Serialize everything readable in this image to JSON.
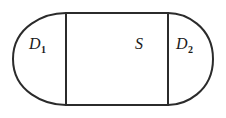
{
  "figure": {
    "name": "stadium-divided-into-three-regions",
    "background_color": "#ffffff",
    "stroke_color": "#2b2b2b",
    "stroke_width": 2,
    "geometry": {
      "left_cap_x": 13,
      "left_divider_x": 66,
      "right_divider_x": 168,
      "right_cap_x": 213,
      "top_y": 13,
      "bottom_y": 105
    },
    "labels": {
      "left_region": {
        "glyph": "D",
        "subscript": "1",
        "full": "D1"
      },
      "middle_region": {
        "glyph": "S",
        "subscript": "",
        "full": "S"
      },
      "right_region": {
        "glyph": "D",
        "subscript": "2",
        "full": "D2"
      }
    }
  }
}
